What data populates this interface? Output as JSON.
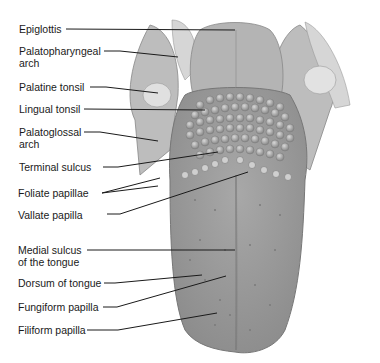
{
  "figure": {
    "labels": [
      {
        "id": "epiglottis",
        "text": "Epiglottis"
      },
      {
        "id": "palatopharyngeal",
        "text": "Palatopharyngeal",
        "text2": "arch"
      },
      {
        "id": "palatine-tonsil",
        "text": "Palatine tonsil"
      },
      {
        "id": "lingual-tonsil",
        "text": "Lingual tonsil"
      },
      {
        "id": "palatoglossal",
        "text": "Palatoglossal",
        "text2": "arch"
      },
      {
        "id": "terminal-sulcus",
        "text": "Terminal sulcus"
      },
      {
        "id": "foliate-papillae",
        "text": "Foliate papillae"
      },
      {
        "id": "vallate-papilla",
        "text": "Vallate papilla"
      },
      {
        "id": "medial-sulcus",
        "text": "Medial sulcus",
        "text2": "of the tongue"
      },
      {
        "id": "dorsum",
        "text": "Dorsum of tongue"
      },
      {
        "id": "fungiform",
        "text": "Fungiform papilla"
      },
      {
        "id": "filiform",
        "text": "Filiform papilla"
      }
    ]
  }
}
